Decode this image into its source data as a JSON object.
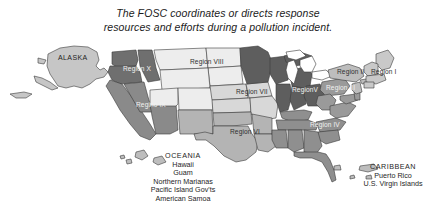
{
  "caption": {
    "line1": "The FOSC coordinates or directs response",
    "line2": "resources and efforts during a pollution incident."
  },
  "map": {
    "alaska_label": "ALASKA",
    "regions": [
      {
        "id": "region-x",
        "label": "Region X",
        "tone": "dark",
        "color": "#6f6f6f"
      },
      {
        "id": "region-ix",
        "label": "Regino IX",
        "tone": "dark",
        "color": "#8a8a8a"
      },
      {
        "id": "region-viii",
        "label": "Region VIII",
        "tone": "dark",
        "color": "#ededed"
      },
      {
        "id": "region-vii",
        "label": "Region VII",
        "tone": "dark",
        "color": "#d8d8d8"
      },
      {
        "id": "region-vi",
        "label": "Region VI",
        "tone": "dark",
        "color": "#b4b4b4"
      },
      {
        "id": "region-v",
        "label": "RegionV",
        "tone": "light",
        "color": "#5e5e5e"
      },
      {
        "id": "region-iv",
        "label": "Region IV",
        "tone": "light",
        "color": "#8f8f8f"
      },
      {
        "id": "region-iii",
        "label": "Region III",
        "tone": "light",
        "color": "#9a9a9a"
      },
      {
        "id": "region-ii",
        "label": "Region II",
        "tone": "dark",
        "color": "#bdbdbd"
      },
      {
        "id": "region-i",
        "label": "Region I",
        "tone": "dark",
        "color": "#c9c9c9"
      }
    ]
  },
  "oceania": {
    "heading": "OCEANIA",
    "items": [
      "Hawaii",
      "Guam",
      "Northern Marianas",
      "Pacific Island Gov'ts",
      "American Samoa"
    ]
  },
  "caribbean": {
    "heading": "CARIBBEAN",
    "items": [
      "Puerto Rico",
      "U.S. Virgin Islands"
    ]
  },
  "colors": {
    "background": "#ffffff",
    "outline": "#3a3a3a",
    "text": "#262626"
  }
}
